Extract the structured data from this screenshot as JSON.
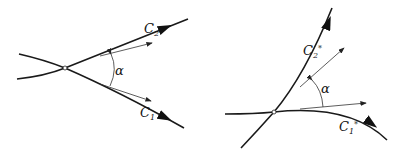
{
  "figure": {
    "left_panel": {
      "curve_1_label": "C",
      "curve_1_sub": "1",
      "curve_2_label": "C",
      "curve_2_sub": "2",
      "angle_label": "α",
      "intersection_point": [
        65,
        68
      ]
    },
    "right_panel": {
      "curve_1_label": "C",
      "curve_1_sub": "1",
      "curve_1_star": "*",
      "curve_2_label": "C",
      "curve_2_sub": "2",
      "curve_2_star": "*",
      "angle_label": "α",
      "intersection_point": [
        274,
        112
      ]
    },
    "colors": {
      "stroke": "#1a1a1a",
      "background": "#ffffff"
    }
  }
}
